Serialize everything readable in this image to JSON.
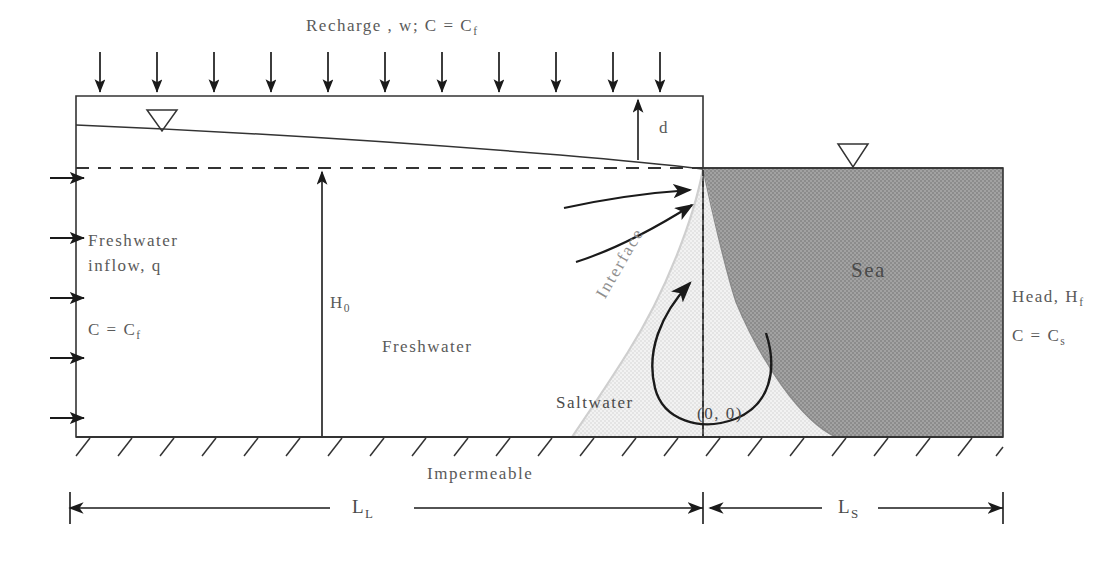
{
  "figure": {
    "type": "cross-section-diagram",
    "labels": {
      "recharge": "Recharge , w; C = C",
      "recharge_sub": "f",
      "depth_d": "d",
      "head_h0": "H",
      "head_h0_sub": "0",
      "freshwater_inflow_line1": "Freshwater",
      "freshwater_inflow_line2": "inflow, q",
      "conc_freshwater": "C = C",
      "conc_freshwater_sub": "f",
      "freshwater_zone": "Freshwater",
      "saltwater_zone": "Saltwater",
      "interface": "Interface",
      "sea_zone": "Sea",
      "head_hf": "Head, H",
      "head_hf_sub": "f",
      "conc_seawater": "C = C",
      "conc_seawater_sub": "s",
      "origin": "(0, 0)",
      "impermeable": "Impermeable",
      "length_land": "L",
      "length_land_sub": "L",
      "length_sea": "L",
      "length_sea_sub": "S"
    },
    "icons": {
      "water_table_inland": "water-table-triangle-icon",
      "water_table_sea": "water-table-triangle-icon",
      "recharge_arrow": "down-arrow-icon",
      "inflow_arrow": "right-arrow-icon",
      "discharge_arrow": "curved-flow-arrow-icon",
      "circulation_arrow": "circulation-loop-arrow-icon",
      "dimension_arrow": "double-headed-dimension-arrow-icon",
      "hatch": "impermeable-hatch-icon"
    },
    "colors": {
      "outline": "#333333",
      "sea_fill": "#9a9a9a",
      "saltwater_fill": "#ededed",
      "text": "#5a5a5a",
      "background": "#ffffff"
    },
    "counts": {
      "recharge_arrows": 11,
      "inflow_arrows": 5,
      "discharge_arrows": 2,
      "hatch_marks": 22
    }
  }
}
